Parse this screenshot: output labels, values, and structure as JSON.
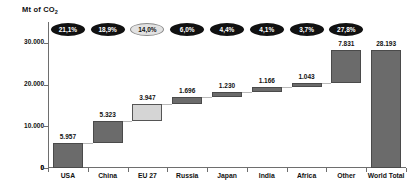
{
  "chart": {
    "type": "waterfall",
    "axis_title": "Mt of CO",
    "axis_title_sub": "2"
  },
  "chart_data": {
    "type": "bar",
    "title": "",
    "xlabel": "",
    "ylabel": "Mt of CO2",
    "ylim": [
      0,
      35000
    ],
    "yticks": [
      "0",
      "10.000",
      "20.000",
      "30.000"
    ],
    "ytick_values": [
      0,
      10000,
      20000,
      30000
    ],
    "grid": false,
    "legend": null,
    "categories": [
      "USA",
      "China",
      "EU 27",
      "Russia",
      "Japan",
      "India",
      "Africa",
      "Other",
      "World Total"
    ],
    "values": [
      5957,
      5323,
      3947,
      1696,
      1230,
      1166,
      1043,
      7831,
      28193
    ],
    "value_labels": [
      "5.957",
      "5.323",
      "3.947",
      "1.696",
      "1.230",
      "1.166",
      "1.043",
      "7.831",
      "28.193"
    ],
    "percent_labels": [
      "21,1%",
      "18,9%",
      "14,0%",
      "6,0%",
      "4,4%",
      "4,1%",
      "3,7%",
      "27,8%",
      ""
    ],
    "cumulative_base": [
      0,
      5957,
      11280,
      15227,
      16923,
      18153,
      19319,
      20362,
      0
    ],
    "highlight_index": 2,
    "total_index": 8,
    "colors": {
      "bar": "#6b6b6b",
      "bar_border": "#4a4a4a",
      "highlight_bar": "#d5d5d5",
      "highlight_border": "#555555",
      "badge": "#111111",
      "badge_light": "#e2e2e2",
      "axis": "#6e6e6e",
      "connector": "#b9b9b9",
      "text": "#111111"
    }
  }
}
